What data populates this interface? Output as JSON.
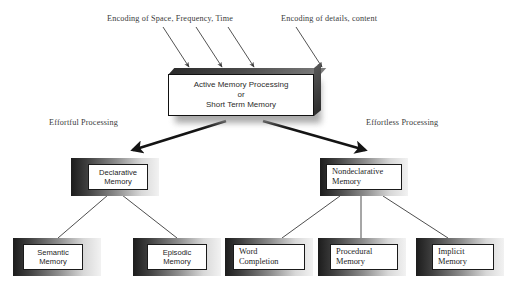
{
  "diagram": {
    "background_color": "#ffffff",
    "captions": [
      {
        "id": "encoding-space",
        "text": "Encoding of Space, Frequency, Time"
      },
      {
        "id": "encoding-details",
        "text": "Encoding of details, content"
      },
      {
        "id": "effortful",
        "text": "Effortful Processing"
      },
      {
        "id": "effortless",
        "text": "Effortless Processing"
      }
    ],
    "central_node": {
      "line1": "Active Memory Processing",
      "line2": "or",
      "line3": "Short Term Memory"
    },
    "level2_nodes": [
      {
        "id": "declarative",
        "line1": "Declarative",
        "line2": "Memory"
      },
      {
        "id": "nondeclarative",
        "line1": "Nondeclarative",
        "line2": "Memory"
      }
    ],
    "level3_nodes": [
      {
        "id": "semantic",
        "line1": "Semantic",
        "line2": "Memory"
      },
      {
        "id": "episodic",
        "line1": "Episodic",
        "line2": "Memory"
      },
      {
        "id": "word-completion",
        "line1": "Word",
        "line2": "Completion"
      },
      {
        "id": "procedural",
        "line1": "Procedural",
        "line2": "Memory"
      },
      {
        "id": "implicit",
        "line1": "Implicit",
        "line2": "Memory"
      }
    ],
    "colors": {
      "line": "#3a3a3a",
      "arrow_thick": "#1a1a1a",
      "box_frame_dark": "#1c1c1c",
      "box_frame_light": "#f2f2f2",
      "text": "#242424"
    }
  }
}
